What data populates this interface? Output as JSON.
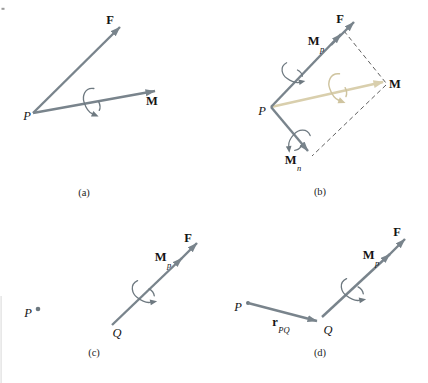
{
  "figure": {
    "colors": {
      "background": "#ffffff",
      "vector": "#79848c",
      "faded_vector": "#d9cfad",
      "arc": "#6e7980",
      "faded_arc": "#cfc49f",
      "dash": "#4d4d4d",
      "label": "#141414",
      "caption": "#1e1e1e"
    },
    "panels": {
      "a": {
        "caption": "(a)",
        "F": "F",
        "M": "M",
        "P": "P"
      },
      "b": {
        "caption": "(b)",
        "F": "F",
        "M": "M",
        "P": "P",
        "Mp_main": "M",
        "Mp_sub": "p",
        "Mn_main": "M",
        "Mn_sub": "n"
      },
      "c": {
        "caption": "(c)",
        "F": "F",
        "P": "P",
        "Q": "Q",
        "Mp_main": "M",
        "Mp_sub": "p"
      },
      "d": {
        "caption": "(d)",
        "F": "F",
        "P": "P",
        "Q": "Q",
        "Mp_main": "M",
        "Mp_sub": "p",
        "r_main": "r",
        "r_sub": "PQ"
      }
    }
  }
}
